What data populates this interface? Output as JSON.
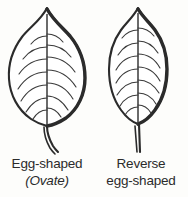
{
  "figure": {
    "background_color": "#fdfdfb",
    "ink_color": "#2b2b2b"
  },
  "leaves": [
    {
      "id": "ovate",
      "icon": "leaf-ovate-icon",
      "description": "Leaf blade widest below the middle, tapering to a sharply pointed tip, with a curved petiole",
      "vein_pairs": 7,
      "caption_lines": [
        {
          "text": "Egg-shaped",
          "style": "regular"
        },
        {
          "text": "(Ovate)",
          "style": "italic"
        }
      ]
    },
    {
      "id": "obovate",
      "icon": "leaf-obovate-icon",
      "description": "Leaf blade widest above the middle, narrowing toward the base, with a short abrupt tip and a straight petiole",
      "vein_pairs": 7,
      "caption_lines": [
        {
          "text": "Reverse",
          "style": "regular"
        },
        {
          "text": "egg-shaped",
          "style": "regular"
        }
      ]
    }
  ]
}
